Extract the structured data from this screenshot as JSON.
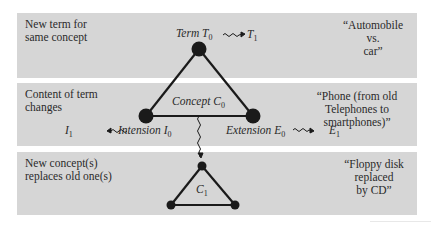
{
  "rows": [
    {
      "label_lines": [
        "New term for",
        "same concept"
      ],
      "example_lines": [
        "“Automobile",
        "vs.",
        "car”"
      ]
    },
    {
      "label_lines": [
        "Content of term",
        "changes"
      ],
      "example_lines": [
        "“Phone (from old",
        "Telephones to",
        "smartphones)”"
      ]
    },
    {
      "label_lines": [
        "New concept(s)",
        "replaces old one(s)"
      ],
      "example_lines": [
        "“Floppy disk",
        "replaced",
        "by CD”"
      ]
    }
  ],
  "diagram": {
    "term": {
      "name": "Term",
      "sym": "T",
      "sub": "0"
    },
    "term_next": {
      "sym": "T",
      "sub": "1"
    },
    "concept": {
      "name": "Concept",
      "sym": "C",
      "sub": "0"
    },
    "concept_next": {
      "sym": "C",
      "sub": "1"
    },
    "intension": {
      "name": "Intension",
      "sym": "I",
      "sub": "0"
    },
    "intension_next": {
      "sym": "I",
      "sub": "1"
    },
    "extension": {
      "name": "Extension",
      "sym": "E",
      "sub": "0"
    },
    "extension_next": {
      "sym": "E",
      "sub": "1"
    }
  },
  "colors": {
    "panel": "#d6d6d6",
    "ink": "#1a1a1a"
  }
}
